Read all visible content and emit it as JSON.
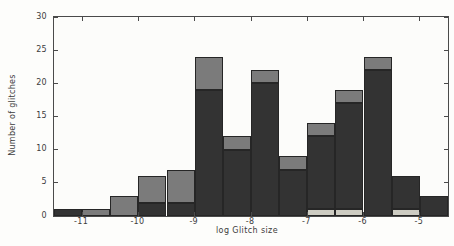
{
  "figure": {
    "xlabel": "log Glitch size",
    "ylabel": "Number of glitches",
    "background_color": "#fdfdfb",
    "axis_color": "#4a4a4a",
    "text_color": "#3c3c3c"
  },
  "chart_data": {
    "type": "bar",
    "subtype": "stacked-histogram",
    "title": "",
    "xlabel": "log Glitch size",
    "ylabel": "Number of glitches",
    "xlim": [
      -11.5,
      -4.5
    ],
    "ylim": [
      0,
      30
    ],
    "x_ticks": [
      -11,
      -10,
      -9,
      -8,
      -7,
      -6,
      -5
    ],
    "y_ticks": [
      0,
      5,
      10,
      15,
      20,
      25,
      30
    ],
    "grid": false,
    "legend": "none",
    "bin_width": 0.5,
    "bin_edges": [
      -11.5,
      -11,
      -10.5,
      -10,
      -9.5,
      -9,
      -8.5,
      -8,
      -7.5,
      -7,
      -6.5,
      -6,
      -5.5,
      -5,
      -4.5
    ],
    "series": [
      {
        "name": "light-gray-bottom",
        "color": "#cdccc2",
        "values": [
          0,
          0,
          0,
          0,
          0,
          0,
          0,
          0,
          0,
          1,
          1,
          0,
          1,
          0
        ]
      },
      {
        "name": "dark",
        "color": "#333333",
        "values": [
          1,
          0,
          0,
          2,
          2,
          19,
          10,
          20,
          7,
          11,
          16,
          22,
          5,
          3
        ]
      },
      {
        "name": "medium-gray-top",
        "color": "#7b7b7b",
        "values": [
          0,
          1,
          3,
          4,
          5,
          5,
          2,
          2,
          2,
          2,
          2,
          2,
          0,
          0
        ]
      }
    ],
    "bin_totals": [
      1,
      1,
      3,
      6,
      7,
      24,
      12,
      22,
      9,
      14,
      19,
      24,
      6,
      3
    ]
  }
}
